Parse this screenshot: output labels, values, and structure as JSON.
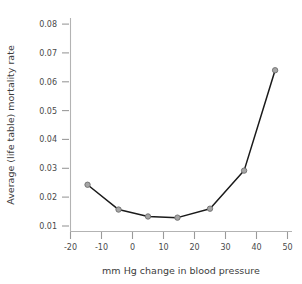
{
  "chart_data": {
    "type": "line",
    "title": "",
    "xlabel": "mm Hg change in blood pressure",
    "ylabel": "Average (life table) mortality rate",
    "xlim": [
      -22,
      54
    ],
    "ylim": [
      0.0085,
      0.0825
    ],
    "xticks": [
      "-20",
      "-10",
      "0",
      "10",
      "20",
      "30",
      "40",
      "50"
    ],
    "xtick_values": [
      -20,
      -10,
      0,
      10,
      20,
      30,
      40,
      50
    ],
    "yticks": [
      "0.08",
      "0.07",
      "0.06",
      "0.05",
      "0.04",
      "0.03",
      "0.02",
      "0.01"
    ],
    "ytick_values": [
      0.08,
      0.07,
      0.06,
      0.05,
      0.04,
      0.03,
      0.02,
      0.01
    ],
    "grid": false,
    "legend": "none",
    "marker": "circle",
    "marker_color": "#a5a5a5",
    "line_color": "#1a1a1a",
    "x": [
      -14.5,
      -4.5,
      5.0,
      14.5,
      25.0,
      36.0,
      46.0
    ],
    "values": [
      0.0243,
      0.0157,
      0.0133,
      0.0129,
      0.016,
      0.0292,
      0.064
    ],
    "points": [
      {
        "x": -14.5,
        "y": 0.0243
      },
      {
        "x": -4.5,
        "y": 0.0157
      },
      {
        "x": 5.0,
        "y": 0.0133
      },
      {
        "x": 14.5,
        "y": 0.0129
      },
      {
        "x": 25.0,
        "y": 0.016
      },
      {
        "x": 36.0,
        "y": 0.0292
      },
      {
        "x": 46.0,
        "y": 0.064
      }
    ]
  },
  "figure": {
    "background_color": "#ffffff",
    "axis_color": "#b3b3b3",
    "text_color": "#3c3c3c"
  }
}
